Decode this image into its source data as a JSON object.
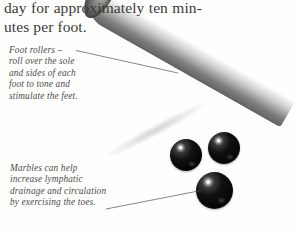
{
  "page": {
    "background_color": "#fdfdfc",
    "text_color": "#3a3a38",
    "caption_color": "#4b4a47"
  },
  "body_text": {
    "lines": [
      {
        "words": [
          "day",
          "for",
          "approximately",
          "ten",
          "min-"
        ],
        "justified": true
      },
      {
        "words": [
          "utes per foot."
        ],
        "justified": false
      }
    ]
  },
  "captions": [
    {
      "id": "foot-rollers",
      "lines": [
        "Foot rollers –",
        "roll over the sole",
        "and sides of each",
        "foot to tone and",
        "stimulate the feet."
      ]
    },
    {
      "id": "marbles",
      "lines": [
        "Marbles can help",
        "increase lymphatic",
        "drainage and circulation",
        "by exercising the toes."
      ]
    }
  ],
  "photo": {
    "roller": {
      "label": "foot-roller",
      "description": "ridged cylindrical wooden foot roller",
      "color": "#8a8a8a"
    },
    "marbles": [
      {
        "label": "marble-left",
        "color": "#0a0a0a"
      },
      {
        "label": "marble-right",
        "color": "#0a0a0a"
      },
      {
        "label": "marble-bottom",
        "color": "#0a0a0a"
      }
    ]
  }
}
